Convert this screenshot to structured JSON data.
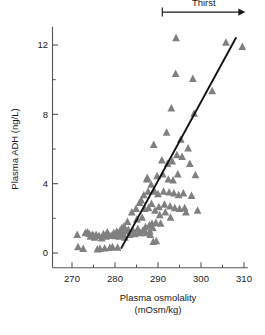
{
  "chart_data": {
    "type": "scatter",
    "title": "",
    "xlabel": "Plasma osmolality",
    "xlabel_units": "(mOsm/kg)",
    "ylabel": "Plasma ADH (ng/L)",
    "xlim": [
      268,
      311
    ],
    "ylim": [
      -0.9,
      13.2
    ],
    "xticks": [
      270,
      280,
      290,
      300,
      310
    ],
    "xtick_labels": [
      "270",
      "280",
      "290",
      "300",
      "310"
    ],
    "xminor_ticks": [
      275,
      285,
      295,
      305
    ],
    "yticks": [
      0,
      4,
      8,
      12
    ],
    "ytick_labels": [
      "0",
      "4",
      "8",
      "12"
    ],
    "yminor_ticks": [
      2,
      6,
      10
    ],
    "grid": false,
    "legend": null,
    "marker": "triangle-up",
    "marker_color": "#808080",
    "marker_size": 4.2,
    "line_color": "#111111",
    "axis_color": "#555555",
    "fit_line": {
      "label": "regression line",
      "x_start": 281.4,
      "y_start": 0.25,
      "x_end": 308.2,
      "y_end": 12.45
    },
    "annotations": [
      {
        "name": "thirst-arrow",
        "label": "Thirst",
        "x_start": 291.0,
        "x_end": 310.3,
        "y": 13.9,
        "style": "arrow-right-with-bar"
      }
    ],
    "points": [
      [
        271.2,
        1.05
      ],
      [
        271.4,
        0.35
      ],
      [
        272.6,
        0.25
      ],
      [
        273.1,
        1.15
      ],
      [
        273.6,
        1.2
      ],
      [
        274.0,
        1.1
      ],
      [
        274.3,
        0.95
      ],
      [
        274.7,
        1.05
      ],
      [
        275.0,
        1.0
      ],
      [
        275.3,
        0.9
      ],
      [
        275.6,
        1.05
      ],
      [
        275.9,
        0.22
      ],
      [
        276.3,
        1.0
      ],
      [
        276.5,
        0.25
      ],
      [
        276.9,
        0.85
      ],
      [
        277.3,
        1.1
      ],
      [
        277.6,
        0.28
      ],
      [
        277.9,
        0.95
      ],
      [
        278.2,
        1.2
      ],
      [
        278.5,
        1.05
      ],
      [
        278.8,
        0.3
      ],
      [
        279.1,
        1.0
      ],
      [
        279.4,
        0.35
      ],
      [
        279.7,
        1.15
      ],
      [
        280.0,
        1.05
      ],
      [
        280.2,
        0.98
      ],
      [
        280.4,
        1.25
      ],
      [
        280.6,
        0.32
      ],
      [
        280.8,
        1.1
      ],
      [
        281.0,
        0.95
      ],
      [
        281.2,
        1.3
      ],
      [
        281.4,
        1.05
      ],
      [
        281.6,
        1.45
      ],
      [
        281.9,
        1.1
      ],
      [
        282.1,
        1.55
      ],
      [
        282.3,
        0.9
      ],
      [
        282.6,
        1.25
      ],
      [
        282.9,
        1.8
      ],
      [
        283.1,
        1.35
      ],
      [
        283.4,
        1.05
      ],
      [
        283.6,
        1.15
      ],
      [
        283.9,
        2.35
      ],
      [
        284.1,
        1.3
      ],
      [
        284.4,
        1.2
      ],
      [
        284.6,
        1.1
      ],
      [
        284.9,
        2.55
      ],
      [
        285.1,
        1.95
      ],
      [
        285.3,
        1.4
      ],
      [
        285.5,
        1.2
      ],
      [
        285.7,
        2.9
      ],
      [
        285.9,
        1.15
      ],
      [
        286.1,
        3.05
      ],
      [
        286.3,
        2.05
      ],
      [
        286.5,
        1.3
      ],
      [
        286.7,
        3.35
      ],
      [
        286.9,
        2.55
      ],
      [
        287.1,
        1.5
      ],
      [
        287.2,
        1.15
      ],
      [
        287.4,
        4.25
      ],
      [
        287.5,
        4.35
      ],
      [
        287.7,
        3.55
      ],
      [
        287.8,
        2.6
      ],
      [
        288.0,
        1.6
      ],
      [
        288.1,
        1.25
      ],
      [
        288.2,
        1.05
      ],
      [
        288.4,
        3.95
      ],
      [
        288.5,
        2.85
      ],
      [
        288.6,
        1.7
      ],
      [
        288.8,
        1.45
      ],
      [
        288.9,
        0.65
      ],
      [
        289.0,
        6.25
      ],
      [
        289.2,
        3.55
      ],
      [
        289.3,
        2.45
      ],
      [
        289.5,
        1.75
      ],
      [
        289.6,
        0.7
      ],
      [
        289.8,
        4.45
      ],
      [
        290.0,
        3.4
      ],
      [
        290.2,
        2.65
      ],
      [
        290.4,
        2.2
      ],
      [
        290.6,
        1.7
      ],
      [
        290.9,
        5.35
      ],
      [
        291.1,
        4.55
      ],
      [
        291.3,
        3.55
      ],
      [
        291.5,
        2.8
      ],
      [
        291.7,
        2.35
      ],
      [
        292.0,
        6.95
      ],
      [
        292.2,
        5.15
      ],
      [
        292.4,
        4.25
      ],
      [
        292.6,
        3.5
      ],
      [
        292.8,
        2.7
      ],
      [
        292.9,
        2.05
      ],
      [
        293.1,
        8.35
      ],
      [
        293.3,
        5.3
      ],
      [
        293.5,
        4.2
      ],
      [
        293.7,
        3.45
      ],
      [
        293.9,
        2.6
      ],
      [
        294.1,
        10.35
      ],
      [
        294.2,
        12.4
      ],
      [
        294.4,
        5.65
      ],
      [
        294.6,
        4.55
      ],
      [
        294.8,
        3.35
      ],
      [
        295.0,
        2.55
      ],
      [
        295.3,
        6.55
      ],
      [
        295.6,
        5.55
      ],
      [
        295.9,
        3.45
      ],
      [
        296.2,
        2.6
      ],
      [
        296.5,
        2.35
      ],
      [
        297.0,
        6.05
      ],
      [
        297.4,
        5.15
      ],
      [
        297.8,
        3.3
      ],
      [
        298.1,
        10.05
      ],
      [
        298.4,
        8.05
      ],
      [
        298.7,
        4.5
      ],
      [
        299.2,
        2.45
      ],
      [
        302.6,
        9.35
      ],
      [
        305.8,
        12.15
      ],
      [
        309.6,
        11.9
      ]
    ]
  }
}
